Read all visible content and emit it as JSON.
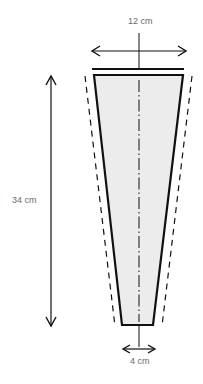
{
  "diagram": {
    "type": "tapered-pattern-piece",
    "labels": {
      "top_width": "12 cm",
      "height": "34 cm",
      "bottom_width": "4 cm"
    },
    "colors": {
      "stroke": "#111111",
      "fill": "#ececec",
      "label": "#6a6a6a",
      "background": "#ffffff"
    }
  }
}
